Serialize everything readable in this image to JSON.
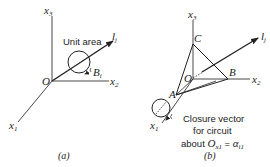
{
  "panel_a": {
    "axes": {
      "x1": "x",
      "x1_sub": "1",
      "x2": "x",
      "x2_sub": "2",
      "x3": "x",
      "x3_sub": "3"
    },
    "origin": "O",
    "vector": "l",
    "vector_sub": "j",
    "area_label": "Unit area",
    "circuit": "B",
    "circuit_sub": "i",
    "caption": "(a)"
  },
  "panel_b": {
    "axes": {
      "x1": "x",
      "x1_sub": "1",
      "x2": "x",
      "x2_sub": "2",
      "x3": "x",
      "x3_sub": "3"
    },
    "origin": "O",
    "points": {
      "A": "A",
      "B": "B",
      "C": "C"
    },
    "vector": "l",
    "vector_sub": "j",
    "note_line1": "Closure vector",
    "note_line2": "for circuit",
    "note_line3_prefix": "about ",
    "note_O": "O",
    "note_O_sub": "x1",
    "note_eq": " = ",
    "note_alpha": "α",
    "note_alpha_sub": "i1",
    "caption": "(b)"
  }
}
